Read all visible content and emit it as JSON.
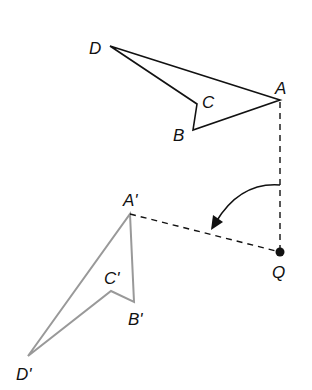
{
  "diagram": {
    "original": {
      "labels": {
        "A": "A",
        "B": "B",
        "C": "C",
        "D": "D"
      },
      "color": "#111111"
    },
    "image": {
      "labels": {
        "A": "A'",
        "B": "B'",
        "C": "C'",
        "D": "D'"
      },
      "color": "#999999"
    },
    "center": {
      "label": "Q"
    },
    "rotation_direction": "counterclockwise"
  }
}
